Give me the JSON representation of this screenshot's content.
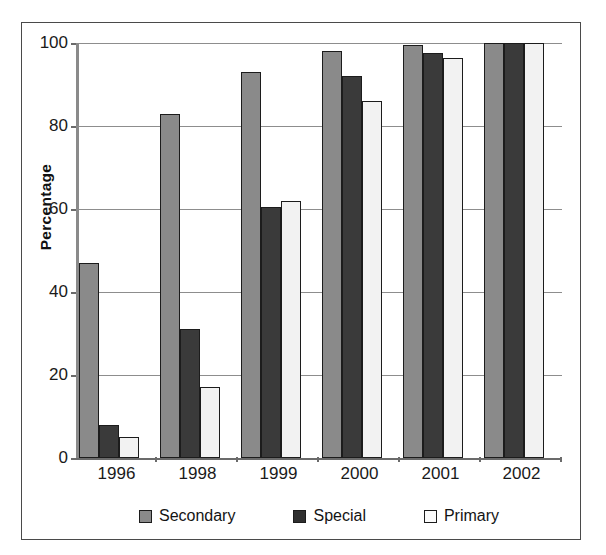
{
  "chart_data": {
    "type": "bar",
    "title": "",
    "xlabel": "",
    "ylabel": "Percentage",
    "ylim": [
      0,
      100
    ],
    "yticks": [
      0,
      20,
      40,
      60,
      80,
      100
    ],
    "grid": true,
    "legend_position": "bottom",
    "categories": [
      "1996",
      "1998",
      "1999",
      "2000",
      "2001",
      "2002"
    ],
    "series": [
      {
        "name": "Secondary",
        "color": "#8a8a8a",
        "values": [
          47,
          83,
          93,
          98,
          99.5,
          100
        ]
      },
      {
        "name": "Special",
        "color": "#3a3a3a",
        "values": [
          8,
          31,
          60.5,
          92,
          97.5,
          100
        ]
      },
      {
        "name": "Primary",
        "color": "#f2f2f2",
        "values": [
          5,
          17,
          62,
          86,
          96.5,
          100
        ]
      }
    ]
  },
  "legend": {
    "items": [
      {
        "label": "Secondary",
        "swatch": "legend-swatch-secondary"
      },
      {
        "label": "Special",
        "swatch": "legend-swatch-special"
      },
      {
        "label": "Primary",
        "swatch": "legend-swatch-primary"
      }
    ]
  }
}
